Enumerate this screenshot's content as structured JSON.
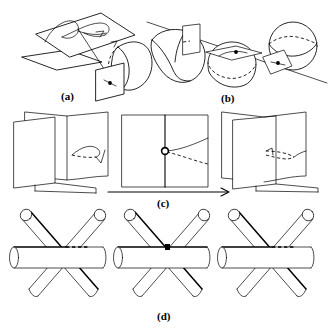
{
  "figure": {
    "background_color": "#ffffff",
    "ink_color": "#000000",
    "width": 331,
    "height": 328,
    "panels": [
      {
        "id": "a",
        "label": "(a)",
        "label_x": 68,
        "label_y": 91,
        "description": "A parallelogram plane carrying a looped curve, a second smaller plane beneath it, a straight line descending to a small vertical plane with a marked point, touching a spherical cap",
        "elements": [
          "large-plane-parallelogram",
          "loop-curve-on-plane",
          "small-lower-plane",
          "descending-line",
          "small-vertical-plane",
          "contact-point-dot",
          "spherical-cap"
        ]
      },
      {
        "id": "b",
        "label": "(b)",
        "label_x": 228,
        "label_y": 93,
        "description": "Three surfaces pierced by one straight line: a tilted cylinder with a transversal plane, a dome with a horizontal tangent plane and marked point, and a sphere with a tilted plane and marked point",
        "elements": [
          "straight-line",
          "tilted-cylinder",
          "plane-on-cylinder",
          "dome-surface",
          "tangent-plane-on-dome",
          "tangency-point-dot-left",
          "sphere",
          "tilted-plane-on-sphere",
          "tangency-point-dot-right"
        ]
      },
      {
        "id": "c",
        "label": "(c)",
        "label_x": 163,
        "label_y": 199,
        "description": "Three stages of a book-fold of two planes: folded open with a curved cusp edge, flattened with a circled double point and two branch curves, refolded the other way with a cusp",
        "stages": [
          "folded-left",
          "flat-middle-with-circled-point",
          "folded-right"
        ],
        "arrow": {
          "name": "transition-arrow",
          "from_x": 108,
          "to_x": 228,
          "y": 192,
          "direction": "left-to-right"
        }
      },
      {
        "id": "d",
        "label": "(d)",
        "label_x": 163,
        "label_y": 313,
        "description": "Three configurations of three mutually crossing cylinders: generic crossing with hidden dashed segment, triple point where all three meet, and the mirror generic crossing",
        "configurations": [
          "three-cylinders-before",
          "three-cylinders-triple-point",
          "three-cylinders-after"
        ]
      }
    ]
  },
  "labels": {
    "a": "(a)",
    "b": "(b)",
    "c": "(c)",
    "d": "(d)"
  }
}
